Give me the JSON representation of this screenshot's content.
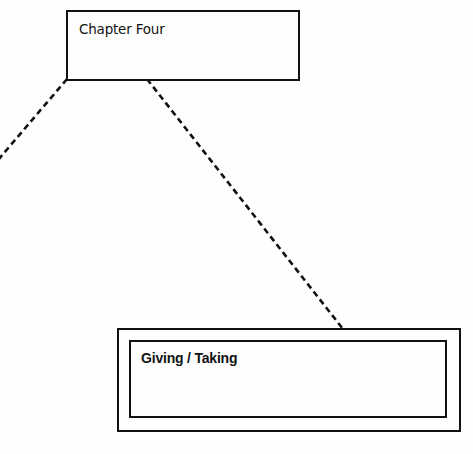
{
  "diagram": {
    "nodes": [
      {
        "id": "chapter-four",
        "label": "Chapter Four",
        "style": "single-border"
      },
      {
        "id": "giving-taking",
        "label": "Giving / Taking",
        "style": "double-border"
      }
    ],
    "edges": [
      {
        "from": "chapter-four",
        "to": "offscreen-left",
        "style": "dashed"
      },
      {
        "from": "chapter-four",
        "to": "giving-taking",
        "style": "dashed"
      }
    ],
    "colors": {
      "background": "#fefefe",
      "stroke": "#111111",
      "text": "#111111"
    }
  }
}
